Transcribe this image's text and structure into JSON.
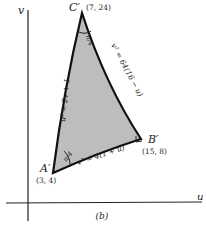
{
  "figure": {
    "caption": "(b)",
    "axes": {
      "x_label": "u",
      "y_label": "v"
    },
    "region": {
      "fill_color": "#bdbdbd",
      "stroke_color": "#111111"
    },
    "vertices": {
      "A": {
        "name": "A′",
        "coords": "(3, 4)"
      },
      "B": {
        "name": "B′",
        "coords": "(15, 8)"
      },
      "C": {
        "name": "C′",
        "coords": "(7, 24)"
      }
    },
    "curves": {
      "AB": "v² = 4(1 + u)",
      "AC": "u² = 2v + 1",
      "BC": "v² = 64(16 − u)"
    },
    "angles": {
      "A": "π/4",
      "C": "π/4",
      "B": "right-angle"
    }
  }
}
